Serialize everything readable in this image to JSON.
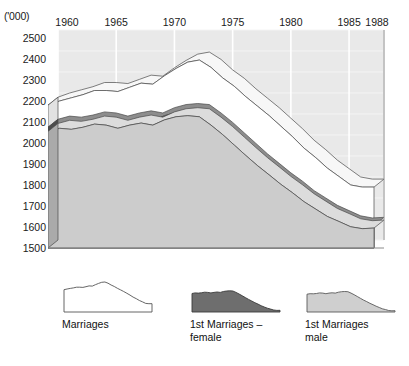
{
  "chart_data": {
    "type": "area",
    "title": "",
    "subtitle": "",
    "xlabel": "",
    "ylabel": "('000)",
    "unit_label": "('000)",
    "grid": true,
    "stacked": true,
    "three_d": true,
    "legend_position": "bottom",
    "xlim": [
      1960,
      1988
    ],
    "ylim": [
      1500,
      2500
    ],
    "x_tick_labels": [
      "1960",
      "1965",
      "1970",
      "1975",
      "1980",
      "1985",
      "1988"
    ],
    "x_tick_values": [
      1960,
      1965,
      1970,
      1975,
      1980,
      1985,
      1988
    ],
    "y_tick_labels": [
      "2500",
      "2400",
      "2300",
      "2200",
      "2100",
      "2000",
      "1900",
      "1800",
      "1700",
      "1600",
      "1500"
    ],
    "y_tick_values": [
      2500,
      2400,
      2300,
      2200,
      2100,
      2000,
      1900,
      1800,
      1700,
      1600,
      1500
    ],
    "x": [
      1960,
      1961,
      1962,
      1963,
      1964,
      1965,
      1966,
      1967,
      1968,
      1969,
      1970,
      1971,
      1972,
      1973,
      1974,
      1975,
      1976,
      1977,
      1978,
      1979,
      1980,
      1981,
      1982,
      1983,
      1984,
      1985,
      1986,
      1987,
      1988
    ],
    "series": [
      {
        "name": "Marriages",
        "color": "#ffffff",
        "values": [
          2180,
          2200,
          2215,
          2230,
          2250,
          2250,
          2245,
          2265,
          2285,
          2280,
          2320,
          2355,
          2385,
          2395,
          2360,
          2310,
          2270,
          2220,
          2175,
          2130,
          2080,
          2030,
          1975,
          1930,
          1880,
          1840,
          1800,
          1790,
          1790
        ]
      },
      {
        "name": "1st Marriages – female",
        "color": "#6e6e6e",
        "values": [
          2075,
          2090,
          2085,
          2095,
          2110,
          2105,
          2090,
          2105,
          2115,
          2105,
          2130,
          2145,
          2150,
          2145,
          2105,
          2060,
          2010,
          1960,
          1910,
          1865,
          1820,
          1780,
          1735,
          1700,
          1665,
          1640,
          1615,
          1605,
          1608
        ]
      },
      {
        "name": "1st Marriages male",
        "color": "#cccccc",
        "values": [
          2055,
          2070,
          2065,
          2075,
          2090,
          2085,
          2070,
          2085,
          2095,
          2085,
          2110,
          2125,
          2130,
          2125,
          2085,
          2040,
          1990,
          1940,
          1892,
          1848,
          1803,
          1763,
          1720,
          1685,
          1650,
          1626,
          1601,
          1592,
          1595
        ]
      }
    ]
  },
  "axes": {
    "unit": "('000)",
    "x_ticks": [
      {
        "label": "1960",
        "value": 1960
      },
      {
        "label": "1965",
        "value": 1965
      },
      {
        "label": "1970",
        "value": 1970
      },
      {
        "label": "1975",
        "value": 1975
      },
      {
        "label": "1980",
        "value": 1980
      },
      {
        "label": "1985",
        "value": 1985
      },
      {
        "label": "1988",
        "value": 1988
      }
    ],
    "y_ticks": [
      {
        "label": "2500",
        "value": 2500
      },
      {
        "label": "2400",
        "value": 2400
      },
      {
        "label": "2300",
        "value": 2300
      },
      {
        "label": "2200",
        "value": 2200
      },
      {
        "label": "2100",
        "value": 2100
      },
      {
        "label": "2000",
        "value": 2000
      },
      {
        "label": "1900",
        "value": 1900
      },
      {
        "label": "1800",
        "value": 1800
      },
      {
        "label": "1700",
        "value": 1700
      },
      {
        "label": "1600",
        "value": 1600
      },
      {
        "label": "1500",
        "value": 1500
      }
    ]
  },
  "legend": {
    "items": [
      {
        "label": "Marriages",
        "color": "#ffffff",
        "stroke": "#555555",
        "icon": "area-swatch-white-icon"
      },
      {
        "label": "1st Marriages –\nfemale",
        "color": "#6e6e6e",
        "stroke": "#3a3a3a",
        "icon": "area-swatch-dark-icon"
      },
      {
        "label": "1st Marriages\nmale",
        "color": "#cfcfcf",
        "stroke": "#5a5a5a",
        "icon": "area-swatch-light-icon"
      }
    ]
  },
  "colors": {
    "plot_background": "#e9e9e9",
    "grid": "#ffffff",
    "marriages": "#ffffff",
    "first_marriages_female": "#6e6e6e",
    "first_marriages_male": "#cccccc",
    "outline": "#4a4a4a",
    "text": "#111111"
  }
}
